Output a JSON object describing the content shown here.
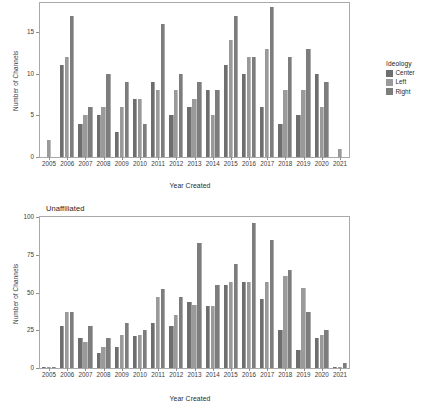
{
  "figure": {
    "background": "#ffffff",
    "panels": [
      "affiliated",
      "unaffiliated"
    ]
  },
  "legend": {
    "title": "Ideology",
    "entries": [
      {
        "label": "Center",
        "color": "#6e6e6e"
      },
      {
        "label": "Left",
        "color": "#9a9a9a"
      },
      {
        "label": "Right",
        "color": "#7d7d7d"
      }
    ]
  },
  "chart_data": [
    {
      "type": "bar",
      "panel_title": "",
      "title": "",
      "xlabel": "Year Created",
      "ylabel": "Number of Channels",
      "ylim": [
        0,
        18.5
      ],
      "yticks": [
        0,
        5,
        10,
        15
      ],
      "ytick_labels": [
        "0",
        "5",
        "10",
        "15"
      ],
      "grid": false,
      "legend_position": "right",
      "categories": [
        "2005",
        "2006",
        "2007",
        "2008",
        "2009",
        "2010",
        "2011",
        "2012",
        "2013",
        "2014",
        "2015",
        "2016",
        "2017",
        "2018",
        "2019",
        "2020",
        "2021"
      ],
      "series": [
        {
          "name": "Center",
          "color": "#6e6e6e",
          "values": [
            null,
            11,
            4,
            5,
            3,
            7,
            9,
            5,
            6,
            8,
            11,
            10,
            6,
            4,
            5,
            10,
            null
          ]
        },
        {
          "name": "Left",
          "color": "#9a9a9a",
          "values": [
            2,
            12,
            5,
            6,
            6,
            7,
            8,
            8,
            7,
            5,
            14,
            12,
            13,
            8,
            8,
            6,
            1
          ]
        },
        {
          "name": "Right",
          "color": "#7d7d7d",
          "values": [
            null,
            17,
            6,
            10,
            9,
            4,
            16,
            10,
            9,
            8,
            17,
            12,
            18,
            12,
            13,
            9,
            null
          ]
        }
      ]
    },
    {
      "type": "bar",
      "panel_title": "Unaffiliated",
      "title": "Unaffiliated",
      "xlabel": "Year Created",
      "ylabel": "Number of Channels",
      "ylim": [
        0,
        100
      ],
      "yticks": [
        0,
        25,
        50,
        75,
        100
      ],
      "ytick_labels": [
        "0",
        "25",
        "50",
        "75",
        "100"
      ],
      "grid": false,
      "legend_position": "right",
      "categories": [
        "2005",
        "2006",
        "2007",
        "2008",
        "2009",
        "2010",
        "2011",
        "2012",
        "2013",
        "2014",
        "2015",
        "2016",
        "2017",
        "2018",
        "2019",
        "2020",
        "2021"
      ],
      "series": [
        {
          "name": "Center",
          "color": "#6e6e6e",
          "values": [
            1,
            28,
            20,
            10,
            14,
            21,
            30,
            28,
            44,
            41,
            55,
            57,
            46,
            25,
            12,
            20,
            1
          ]
        },
        {
          "name": "Left",
          "color": "#9a9a9a",
          "values": [
            1,
            37,
            17,
            14,
            22,
            22,
            47,
            35,
            42,
            41,
            57,
            57,
            57,
            61,
            53,
            22,
            1
          ]
        },
        {
          "name": "Right",
          "color": "#7d7d7d",
          "values": [
            1,
            37,
            28,
            20,
            30,
            25,
            52,
            47,
            83,
            55,
            69,
            96,
            85,
            65,
            37,
            25,
            3
          ]
        }
      ]
    }
  ]
}
